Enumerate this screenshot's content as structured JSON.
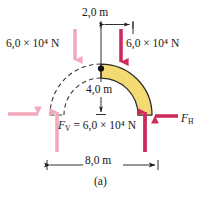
{
  "figure": {
    "caption": "(a)",
    "colors": {
      "arch_fill": "#f3da72",
      "arch_stroke": "#2b2b2b",
      "force_primary": "#cc2c5c",
      "force_mirror": "#f2aabb",
      "dimension_line": "#1a1a1a",
      "background": "#ffffff"
    }
  },
  "dimensions": {
    "top_span": "2,0 m",
    "height": "4,0 m",
    "base_span": "8,0 m"
  },
  "forces": {
    "left_vertical_load": "6,0 × 10⁴ N",
    "right_vertical_load": "6,0 × 10⁴ N",
    "vertical_reaction_symbol": "F",
    "vertical_reaction_sub": "V",
    "vertical_reaction_value": "= 6,0 × 10⁴ N",
    "horizontal_reaction_symbol": "F",
    "horizontal_reaction_sub": "H"
  },
  "arch": {
    "apex_point_label": "apex",
    "solid_half": "right",
    "dashed_half": "left"
  }
}
